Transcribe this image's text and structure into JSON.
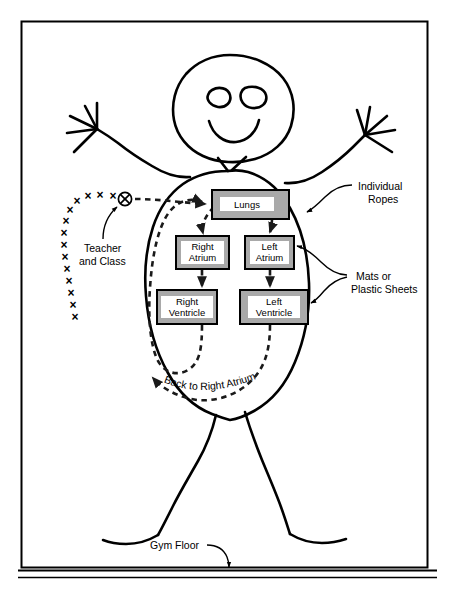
{
  "figure": {
    "frame": {
      "stroke_color": "#000000"
    },
    "floor_label": "Gym Floor"
  },
  "colors": {
    "box_fill": "#a9a9a9",
    "box_stroke": "#000000",
    "label_fill": "#ffffff",
    "line": "#000000",
    "dashed_path": "#1a1a1a"
  },
  "organ_boxes": [
    {
      "id": "lungs",
      "label_line1": "Lungs",
      "label_line2": "",
      "x": 212,
      "y": 190,
      "w": 77,
      "h": 29
    },
    {
      "id": "right-atrium",
      "label_line1": "Right",
      "label_line2": "Atrium",
      "x": 176,
      "y": 236,
      "w": 53,
      "h": 33
    },
    {
      "id": "left-atrium",
      "label_line1": "Left",
      "label_line2": "Atrium",
      "x": 245,
      "y": 236,
      "w": 49,
      "h": 33
    },
    {
      "id": "right-ventricle",
      "label_line1": "Right",
      "label_line2": "Ventricle",
      "x": 157,
      "y": 290,
      "w": 60,
      "h": 34
    },
    {
      "id": "left-ventricle",
      "label_line1": "Left",
      "label_line2": "Ventricle",
      "x": 240,
      "y": 290,
      "w": 68,
      "h": 34
    }
  ],
  "callouts": [
    {
      "id": "teacher-and-class",
      "line1": "Teacher",
      "line2": "and Class",
      "x": 84,
      "y": 249
    },
    {
      "id": "individual-ropes",
      "line1": "Individual",
      "line2": "Ropes",
      "x": 360,
      "y": 187
    },
    {
      "id": "mats-or-sheets",
      "line1": "Mats or",
      "line2": "Plastic Sheets",
      "x": 355,
      "y": 277
    }
  ],
  "path_label": {
    "id": "back-to-right-atrium",
    "text": "Back to Right Atrium"
  },
  "queue": {
    "id": "teacher-and-class-queue",
    "glyph": "×",
    "leader_glyph": "⊗",
    "leader": {
      "x": 125,
      "y": 199
    },
    "marks": [
      {
        "x": 113,
        "y": 197
      },
      {
        "x": 100,
        "y": 196
      },
      {
        "x": 88,
        "y": 197
      },
      {
        "x": 77,
        "y": 202
      },
      {
        "x": 70,
        "y": 211
      },
      {
        "x": 66,
        "y": 222
      },
      {
        "x": 64,
        "y": 234
      },
      {
        "x": 64,
        "y": 246
      },
      {
        "x": 65,
        "y": 258
      },
      {
        "x": 67,
        "y": 270
      },
      {
        "x": 69,
        "y": 282
      },
      {
        "x": 71,
        "y": 294
      },
      {
        "x": 73,
        "y": 306
      },
      {
        "x": 75,
        "y": 318
      }
    ]
  },
  "flow": {
    "arrows": [
      {
        "id": "queue-to-lungs",
        "from": "teacher-and-class-queue",
        "to": "lungs"
      },
      {
        "id": "lungs-to-right-atrium",
        "from": "lungs",
        "to": "right-atrium"
      },
      {
        "id": "lungs-to-left-atrium",
        "from": "lungs",
        "to": "left-atrium"
      },
      {
        "id": "right-atrium-to-ventricle",
        "from": "right-atrium",
        "to": "right-ventricle"
      },
      {
        "id": "left-atrium-to-ventricle",
        "from": "left-atrium",
        "to": "left-ventricle"
      },
      {
        "id": "right-ventricle-to-lungs",
        "from": "right-ventricle",
        "to": "lungs"
      },
      {
        "id": "left-ventricle-return",
        "from": "left-ventricle",
        "to": "right-atrium"
      }
    ]
  }
}
